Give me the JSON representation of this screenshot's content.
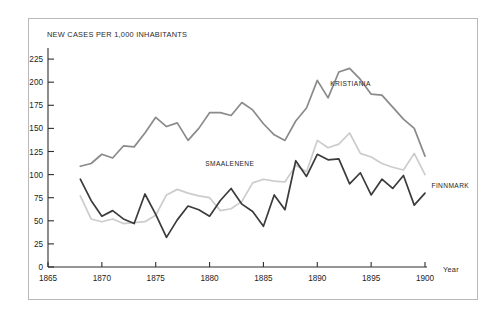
{
  "figure": {
    "page_bleed_text": "",
    "frame_border_color": "#b9b9b9"
  },
  "chart_data": {
    "type": "line",
    "title": "",
    "subtitle": "",
    "xlabel": "Year",
    "ylabel": "NEW CASES PER 1,000 INHABITANTS",
    "xlim": [
      1865,
      1901.5
    ],
    "ylim": [
      0,
      237
    ],
    "grid": false,
    "legend_position": "inline-annotations",
    "yticks": [
      0,
      25,
      50,
      75,
      100,
      125,
      150,
      175,
      200,
      225
    ],
    "ytick_labels": [
      "0",
      "25",
      "50",
      "75",
      "100",
      "125",
      "150",
      "175",
      "200",
      "225"
    ],
    "xticks": [
      1865,
      1870,
      1875,
      1880,
      1885,
      1890,
      1895,
      1900
    ],
    "xtick_labels": [
      "1865",
      "1870",
      "1875",
      "1880",
      "1885",
      "1890",
      "1895",
      "1900"
    ],
    "x": [
      1868,
      1869,
      1870,
      1871,
      1872,
      1873,
      1874,
      1875,
      1876,
      1877,
      1878,
      1879,
      1880,
      1881,
      1882,
      1883,
      1884,
      1885,
      1886,
      1887,
      1888,
      1889,
      1890,
      1891,
      1892,
      1893,
      1894,
      1895,
      1896,
      1897,
      1898,
      1899,
      1900
    ],
    "series": [
      {
        "name": "KRISTIANIA",
        "color": "#8a8a8a",
        "label_x": 1891.2,
        "label_y": 196,
        "values": [
          109,
          112,
          122,
          118,
          131,
          130,
          145,
          162,
          152,
          156,
          137,
          150,
          167,
          167,
          164,
          178,
          170,
          155,
          143,
          137,
          158,
          172,
          202,
          183,
          211,
          215,
          203,
          187,
          186,
          173,
          160,
          150,
          120
        ]
      },
      {
        "name": "SMAALENENE",
        "color": "#cccccc",
        "label_x": 1879.6,
        "label_y": 109,
        "values": [
          77,
          52,
          49,
          52,
          47,
          48,
          49,
          56,
          78,
          84,
          80,
          77,
          75,
          61,
          63,
          71,
          91,
          95,
          93,
          92,
          110,
          103,
          137,
          129,
          133,
          145,
          123,
          119,
          112,
          108,
          105,
          123,
          100
        ]
      },
      {
        "name": "FINNMARK",
        "color": "#3b3b3b",
        "label_x": 1900.6,
        "label_y": 85,
        "values": [
          95,
          72,
          55,
          61,
          52,
          47,
          79,
          57,
          32,
          51,
          66,
          62,
          55,
          72,
          85,
          68,
          60,
          44,
          78,
          62,
          115,
          98,
          122,
          116,
          117,
          90,
          102,
          78,
          95,
          85,
          99,
          67,
          80
        ]
      }
    ]
  }
}
